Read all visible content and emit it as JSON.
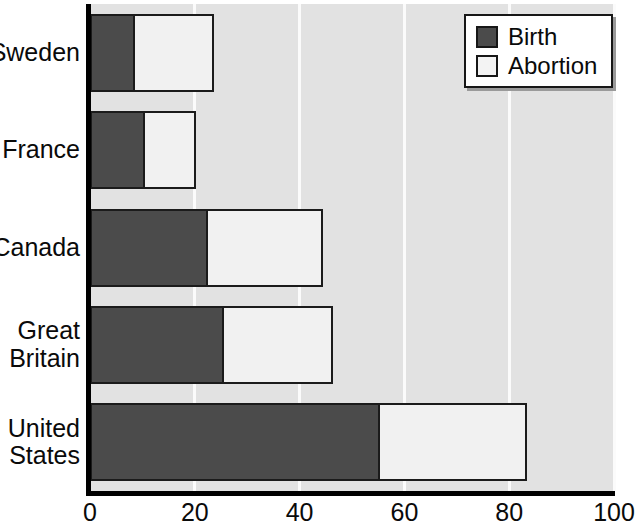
{
  "chart_data": {
    "type": "bar",
    "orientation": "horizontal",
    "stacked": true,
    "title": "",
    "xlabel": "",
    "ylabel": "",
    "xlim": [
      0,
      100
    ],
    "xticks": [
      0,
      20,
      40,
      60,
      80,
      100
    ],
    "xtick_labels": [
      "0",
      "20",
      "40",
      "60",
      "80",
      "100"
    ],
    "grid": true,
    "grid_axis": "x",
    "legend_position": "top-right",
    "categories": [
      "Sweden",
      "France",
      "Canada",
      "Great Britain",
      "United States"
    ],
    "category_labels": [
      [
        "Sweden"
      ],
      [
        "France"
      ],
      [
        "Canada"
      ],
      [
        "Great",
        "Britain"
      ],
      [
        "United",
        "States"
      ]
    ],
    "series": [
      {
        "name": "Birth",
        "color": "#4b4b4b",
        "values": [
          8.4,
          10.3,
          22.3,
          25.4,
          55.2
        ]
      },
      {
        "name": "Abortion",
        "color": "#f1f1f1",
        "values": [
          15.3,
          9.9,
          22.2,
          21.0,
          28.2
        ]
      }
    ],
    "totals": [
      23.7,
      20.2,
      44.5,
      46.4,
      83.4
    ]
  },
  "legend": {
    "items": [
      {
        "label": "Birth",
        "swatch": "birth"
      },
      {
        "label": "Abortion",
        "swatch": "abortion"
      }
    ]
  },
  "colors": {
    "birth": "#4b4b4b",
    "abortion": "#f1f1f1",
    "plot_background": "#e2e2e2",
    "gridline": "#fbfbfb",
    "axis": "#000000",
    "text": "#0a0a0a"
  }
}
